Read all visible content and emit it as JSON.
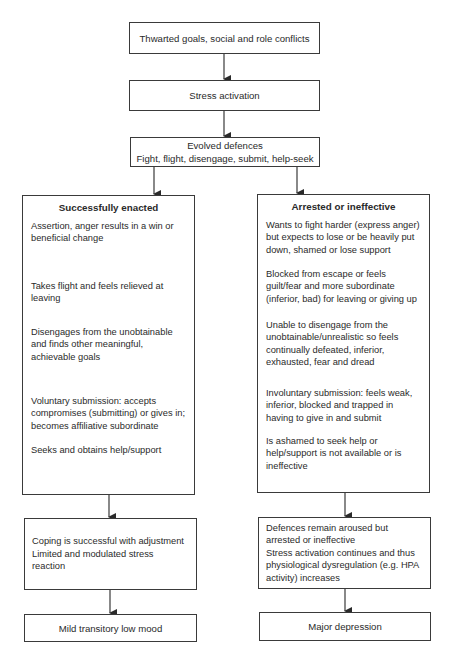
{
  "flowchart": {
    "top_boxes": [
      {
        "text": "Thwarted goals, social and role conflicts"
      },
      {
        "text": "Stress activation"
      },
      {
        "line1": "Evolved defences",
        "line2": "Fight, flight, disengage, submit, help-seek"
      }
    ],
    "left_branch": {
      "title": "Successfully enacted",
      "items": [
        "Assertion, anger results in a win or beneficial change",
        "Takes flight and feels relieved at leaving",
        "Disengages from the unobtainable and finds other meaningful, achievable goals",
        "Voluntary submission: accepts compromises (submitting) or gives in; becomes affiliative subordinate",
        "Seeks and obtains help/support"
      ],
      "outcome_lines": [
        "Coping is successful with adjustment",
        "Limited and modulated stress reaction"
      ],
      "final": "Mild transitory low mood"
    },
    "right_branch": {
      "title": "Arrested or ineffective",
      "items": [
        "Wants to fight harder (express anger) but expects to lose or be heavily put down, shamed or lose support",
        "Blocked from escape or feels guilt/fear and more subordinate (inferior, bad) for leaving or giving up",
        "Unable to disengage from the unobtainable/unrealistic so feels continually defeated, inferior, exhausted, fear and dread",
        "Involuntary submission: feels weak, inferior, blocked and trapped in having to give in and submit",
        "Is ashamed to seek help or help/support is not available or is ineffective"
      ],
      "outcome_lines": [
        "Defences remain aroused but arrested or ineffective",
        "Stress activation continues and thus physiological dysregulation (e.g. HPA activity) increases"
      ],
      "final": "Major depression"
    }
  }
}
